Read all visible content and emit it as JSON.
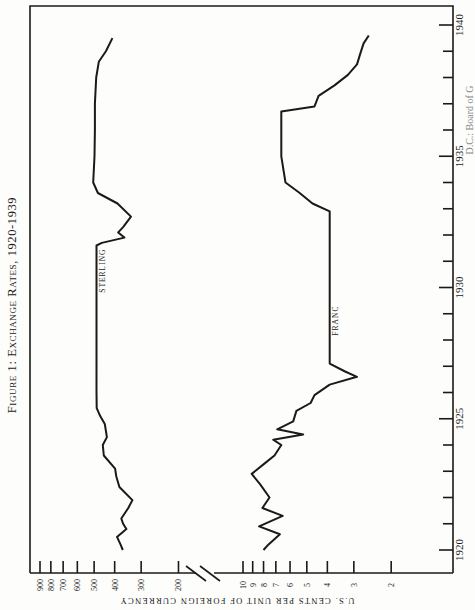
{
  "figure": {
    "title": "Figure 1: Exchange Rates, 1920-1939",
    "ylabel": "U.S. CENTS PER UNIT OF FOREIGN CURRENCY",
    "source_note_fragment": "D.C.: Board of G"
  },
  "chart_data": {
    "type": "line",
    "title": "Figure 1: Exchange Rates, 1920-1939",
    "xlabel": "",
    "ylabel": "U.S. cents per unit of foreign currency",
    "orientation": "rotated 90° (years run bottom-to-top along right edge; values run along bottom, decreasing left-to-right)",
    "scale": "log, with axis break between 200 and 10",
    "xlim": [
      1920,
      1940
    ],
    "x_ticks": [
      1920,
      1925,
      1930,
      1935,
      1940
    ],
    "y_ticks_upper": [
      900,
      800,
      700,
      600,
      500,
      400,
      300,
      200
    ],
    "y_ticks_lower": [
      10,
      9,
      8,
      7,
      6,
      5,
      4,
      3,
      2
    ],
    "grid": false,
    "legend": "inline labels",
    "series": [
      {
        "name": "STERLING",
        "points": [
          [
            1920.0,
            366
          ],
          [
            1920.2,
            375
          ],
          [
            1920.5,
            390
          ],
          [
            1920.8,
            352
          ],
          [
            1921.0,
            365
          ],
          [
            1921.2,
            372
          ],
          [
            1921.6,
            345
          ],
          [
            1921.9,
            330
          ],
          [
            1922.4,
            380
          ],
          [
            1922.8,
            393
          ],
          [
            1923.1,
            398
          ],
          [
            1923.6,
            450
          ],
          [
            1924.0,
            455
          ],
          [
            1924.3,
            435
          ],
          [
            1924.8,
            445
          ],
          [
            1925.1,
            468
          ],
          [
            1925.4,
            486
          ],
          [
            1926.0,
            487
          ],
          [
            1928.0,
            487
          ],
          [
            1930.0,
            487
          ],
          [
            1931.6,
            487
          ],
          [
            1931.7,
            460
          ],
          [
            1931.9,
            360
          ],
          [
            1932.1,
            385
          ],
          [
            1932.3,
            365
          ],
          [
            1932.7,
            335
          ],
          [
            1933.2,
            388
          ],
          [
            1933.6,
            480
          ],
          [
            1934.0,
            505
          ],
          [
            1935.0,
            498
          ],
          [
            1936.0,
            496
          ],
          [
            1937.0,
            496
          ],
          [
            1938.0,
            489
          ],
          [
            1938.6,
            475
          ],
          [
            1939.0,
            440
          ],
          [
            1939.5,
            410
          ]
        ],
        "label_position_year": 1929.5
      },
      {
        "name": "FRANC",
        "points": [
          [
            1920.0,
            8.0
          ],
          [
            1920.2,
            7.6
          ],
          [
            1920.6,
            6.7
          ],
          [
            1920.9,
            8.4
          ],
          [
            1921.3,
            6.5
          ],
          [
            1921.6,
            8.1
          ],
          [
            1922.0,
            7.5
          ],
          [
            1922.5,
            8.3
          ],
          [
            1922.9,
            9.1
          ],
          [
            1923.3,
            7.9
          ],
          [
            1923.6,
            7.1
          ],
          [
            1924.0,
            6.6
          ],
          [
            1924.2,
            7.2
          ],
          [
            1924.4,
            5.2
          ],
          [
            1924.6,
            6.9
          ],
          [
            1924.9,
            5.8
          ],
          [
            1925.3,
            5.6
          ],
          [
            1925.6,
            4.8
          ],
          [
            1925.9,
            4.6
          ],
          [
            1926.3,
            3.9
          ],
          [
            1926.6,
            2.9
          ],
          [
            1926.8,
            3.3
          ],
          [
            1927.1,
            3.9
          ],
          [
            1927.3,
            3.9
          ],
          [
            1929.0,
            3.9
          ],
          [
            1931.0,
            3.9
          ],
          [
            1932.9,
            3.9
          ],
          [
            1933.2,
            4.7
          ],
          [
            1933.6,
            5.4
          ],
          [
            1934.0,
            6.3
          ],
          [
            1935.0,
            6.6
          ],
          [
            1936.0,
            6.6
          ],
          [
            1936.7,
            6.6
          ],
          [
            1936.9,
            4.6
          ],
          [
            1937.3,
            4.4
          ],
          [
            1937.7,
            3.7
          ],
          [
            1938.1,
            3.2
          ],
          [
            1938.5,
            2.9
          ],
          [
            1938.9,
            2.8
          ],
          [
            1939.3,
            2.7
          ],
          [
            1939.6,
            2.55
          ]
        ],
        "label_position_year": 1929.5
      }
    ]
  },
  "style": {
    "line_color": "#1a1a1a",
    "background": "#fdfdfb"
  }
}
